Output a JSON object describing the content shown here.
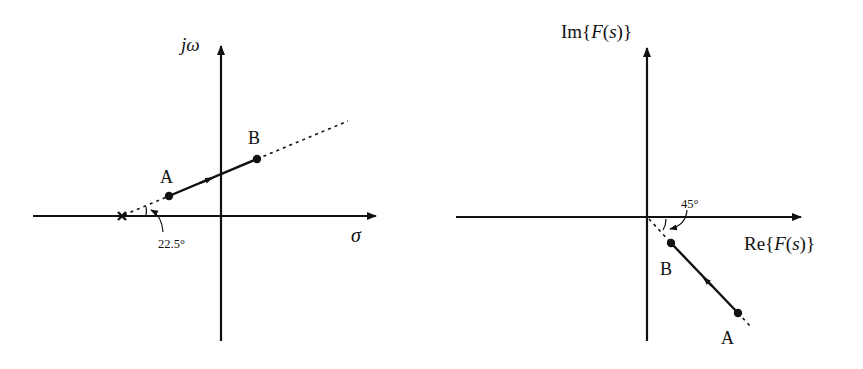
{
  "left_panel": {
    "title": "s-plane",
    "vertical_axis_label": "jω",
    "horizontal_axis_label": "σ",
    "pole_marker": "×",
    "point_a_label": "A",
    "point_b_label": "B",
    "angle_label": "22.5°",
    "angle_degrees": 22.5,
    "path_direction": "A to B"
  },
  "right_panel": {
    "title": "F(s)-plane",
    "vertical_axis_label_prefix": "Im{",
    "vertical_axis_label_fn": "F",
    "vertical_axis_label_suffix_open": "(",
    "vertical_axis_label_var": "s",
    "vertical_axis_label_suffix_close": ")}",
    "horizontal_axis_label_prefix": "Re{",
    "horizontal_axis_label_fn": "F",
    "horizontal_axis_label_suffix_open": "(",
    "horizontal_axis_label_var": "s",
    "horizontal_axis_label_suffix_close": ")}",
    "point_a_label": "A",
    "point_b_label": "B",
    "angle_label": "45°",
    "angle_degrees": -45,
    "path_direction": "A to B"
  },
  "colors": {
    "ink": "#111111",
    "background": "#ffffff"
  }
}
